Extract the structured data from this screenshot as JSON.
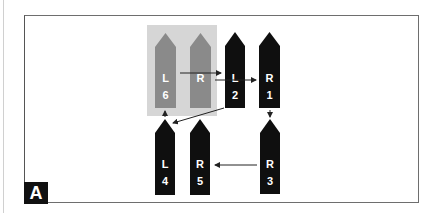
{
  "panel": {
    "label": "A"
  },
  "colors": {
    "active_shape": "#0f0f0f",
    "inactive_shape": "#8a8a8a",
    "highlight_box": "#d6d6d6",
    "arrow": "#222222",
    "frame": "#6e6e6e"
  },
  "shapes": [
    {
      "id": "L6",
      "side": "L",
      "number": "6",
      "state": "inactive"
    },
    {
      "id": "R6",
      "side": "R",
      "number": "",
      "state": "inactive"
    },
    {
      "id": "L2",
      "side": "L",
      "number": "2",
      "state": "active"
    },
    {
      "id": "R1",
      "side": "R",
      "number": "1",
      "state": "active"
    },
    {
      "id": "L4",
      "side": "L",
      "number": "4",
      "state": "active"
    },
    {
      "id": "R5",
      "side": "R",
      "number": "5",
      "state": "active"
    },
    {
      "id": "R3",
      "side": "R",
      "number": "3",
      "state": "active"
    }
  ],
  "arrows": [
    {
      "from": "L6",
      "to": "L2"
    },
    {
      "from": "R6",
      "to": "R1"
    },
    {
      "from": "L2",
      "to": "L4"
    },
    {
      "from": "R1",
      "to": "R3"
    },
    {
      "from": "R3",
      "to": "R5"
    },
    {
      "from": "L4",
      "to": "L6"
    }
  ]
}
